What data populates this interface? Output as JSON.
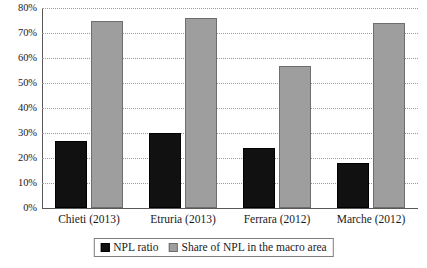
{
  "chart_data": {
    "type": "bar",
    "title": "",
    "subtitle": "",
    "xlabel": "",
    "ylabel": "",
    "ylim": [
      0,
      80
    ],
    "ytick_values": [
      0,
      10,
      20,
      30,
      40,
      50,
      60,
      70,
      80
    ],
    "ytick_labels": [
      "0%",
      "10%",
      "20%",
      "30%",
      "40%",
      "50%",
      "60%",
      "70%",
      "80%"
    ],
    "grid": true,
    "grid_style": "dotted-horizontal",
    "legend_position": "bottom-center",
    "legend_boxed": true,
    "categories": [
      "Chieti (2013)",
      "Etruria (2013)",
      "Ferrara (2012)",
      "Marche (2012)"
    ],
    "series": [
      {
        "name": "NPL ratio",
        "color": "#111111",
        "values": [
          27,
          30,
          24,
          18
        ]
      },
      {
        "name": "Share of NPL in the macro area",
        "color": "#9e9e9e",
        "values": [
          75,
          76,
          57,
          74
        ]
      }
    ]
  },
  "legend": {
    "entries": [
      {
        "label": "NPL ratio"
      },
      {
        "label": "Share of NPL in the macro area"
      }
    ]
  }
}
